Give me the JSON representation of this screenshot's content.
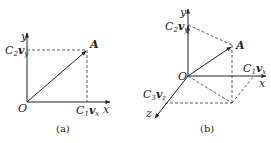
{
  "figures": [
    {
      "id": "a",
      "caption": "(a)",
      "origin_label": "O",
      "x_axis_label": "x",
      "y_axis_label": "y",
      "point_label": "A",
      "x_component": {
        "coef": "C",
        "coef_sub": "1",
        "var": "v",
        "var_sub": "x"
      },
      "y_component": {
        "coef": "C",
        "coef_sub": "2",
        "var": "v",
        "var_sub": "y"
      }
    },
    {
      "id": "b",
      "caption": "(b)",
      "origin_label": "O",
      "x_axis_label": "x",
      "y_axis_label": "y",
      "z_axis_label": "z",
      "point_label": "A",
      "x_component": {
        "coef": "C",
        "coef_sub": "1",
        "var": "v",
        "var_sub": "x"
      },
      "y_component": {
        "coef": "C",
        "coef_sub": "2",
        "var": "v",
        "var_sub": "y"
      },
      "z_component": {
        "coef": "C",
        "coef_sub": "3",
        "var": "v",
        "var_sub": "z"
      }
    }
  ],
  "colors": {
    "line": "#222222",
    "background": "#ffffff"
  }
}
